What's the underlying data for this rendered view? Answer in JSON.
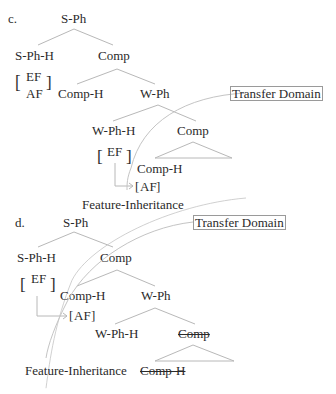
{
  "diagram": {
    "panel_c": {
      "label": "c.",
      "root": "S-Ph",
      "s_ph_h": "S-Ph-H",
      "comp_1": "Comp",
      "feature_ef": "EF",
      "feature_af": "AF",
      "comp_h_1": "Comp-H",
      "w_ph": "W-Ph",
      "transfer_domain": "Transfer Domain",
      "w_ph_h": "W-Ph-H",
      "comp_2": "Comp",
      "w_ef": "EF",
      "comp_h_2": "Comp-H",
      "inherited_af": "AF",
      "feature_inheritance": "Feature-Inheritance"
    },
    "panel_d": {
      "label": "d.",
      "root": "S-Ph",
      "transfer_domain": "Transfer Domain",
      "s_ph_h": "S-Ph-H",
      "comp_1": "Comp",
      "feature_ef": "EF",
      "comp_h_1": "Comp-H",
      "w_ph": "W-Ph",
      "inherited_af": "AF",
      "w_ph_h": "W-Ph-H",
      "comp_2_struck": "Comp",
      "feature_inheritance": "Feature-Inheritance",
      "comp_h_2_struck": "Comp-H"
    },
    "colors": {
      "text": "#2a2a2a",
      "branch": "#b0b0b0",
      "curve": "#c0c0c0",
      "box": "#9a9a9a"
    }
  }
}
